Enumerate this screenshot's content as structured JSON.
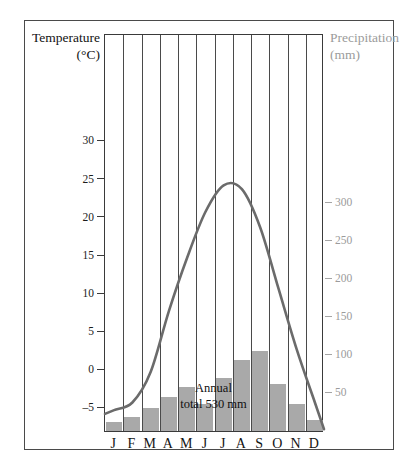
{
  "figure": {
    "clipped_top_text": "",
    "annual_line1": "Annual",
    "annual_line2": "total  530 mm"
  },
  "axes": {
    "left_title_line1": "Temperature",
    "left_title_line2": "(°C)",
    "right_title_line1": "Precipitation",
    "right_title_line2": "(mm)"
  },
  "colors": {
    "bar_fill": "#a9a9a9",
    "curve": "#6b6b6b",
    "frame": "#3a3a3a",
    "right_axis_text": "#9b9b9b",
    "left_axis_text": "#1b1b1b"
  },
  "chart_data": {
    "type": "bar",
    "title": "",
    "subtitle": "",
    "categories": [
      "J",
      "F",
      "M",
      "A",
      "M",
      "J",
      "J",
      "A",
      "S",
      "O",
      "N",
      "D"
    ],
    "month_names": [
      "January",
      "February",
      "March",
      "April",
      "May",
      "June",
      "July",
      "August",
      "September",
      "October",
      "November",
      "December"
    ],
    "series": [
      {
        "name": "Precipitation",
        "type": "bar",
        "unit": "mm",
        "axis": "right",
        "values": [
          12,
          18,
          30,
          45,
          58,
          35,
          70,
          93,
          105,
          62,
          35,
          15
        ]
      },
      {
        "name": "Temperature",
        "type": "line",
        "unit": "°C",
        "axis": "left",
        "values": [
          -5,
          -4,
          0,
          8,
          15,
          21,
          24.5,
          24,
          19,
          11,
          3,
          -4
        ]
      }
    ],
    "xlabel": "",
    "ylabel": "Temperature (°C)",
    "y2label": "Precipitation (mm)",
    "ylim": [
      -8,
      33
    ],
    "y2lim": [
      0,
      340
    ],
    "yticks": [
      30,
      25,
      20,
      15,
      10,
      5,
      0,
      -5
    ],
    "ytick_labels": [
      "30",
      "25",
      "20",
      "15",
      "10",
      "5",
      "0",
      "–5"
    ],
    "y2ticks": [
      300,
      250,
      200,
      150,
      100,
      50
    ],
    "y2tick_labels": [
      "300",
      "250",
      "200",
      "150",
      "100",
      "50"
    ],
    "grid": "vertical-month-separators",
    "legend": "none",
    "annotations": [
      {
        "text": "Annual total 530 mm",
        "value": 530,
        "unit": "mm"
      }
    ]
  }
}
